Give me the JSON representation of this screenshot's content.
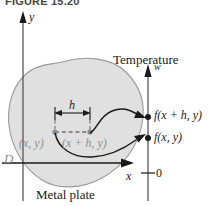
{
  "figure": {
    "caption": "FIGURE 15.20",
    "plate_label": "Metal plate",
    "temperature_label": "Temperature",
    "domain_label": "D"
  },
  "axes": {
    "xy_plane": {
      "x_axis_label": "x",
      "y_axis_label": "y"
    },
    "w_axis": {
      "axis_label": "w",
      "origin_tick_label": "0"
    }
  },
  "annotations": {
    "increment_label": "h",
    "point_base": "(x,  y)",
    "point_shifted": "(x + h,  y)",
    "value_shifted": "f(x + h, y)",
    "value_base": "f(x, y)"
  },
  "colors": {
    "plate_fill": "#e0e0e0",
    "plate_outline": "#9a9a9a",
    "axis": "#1a1a1a",
    "grey_text": "#8f8f8f",
    "dark_text": "#1a1a1a",
    "dot_grey": "#8a8a8a",
    "dot_black": "#1a1a1a"
  }
}
